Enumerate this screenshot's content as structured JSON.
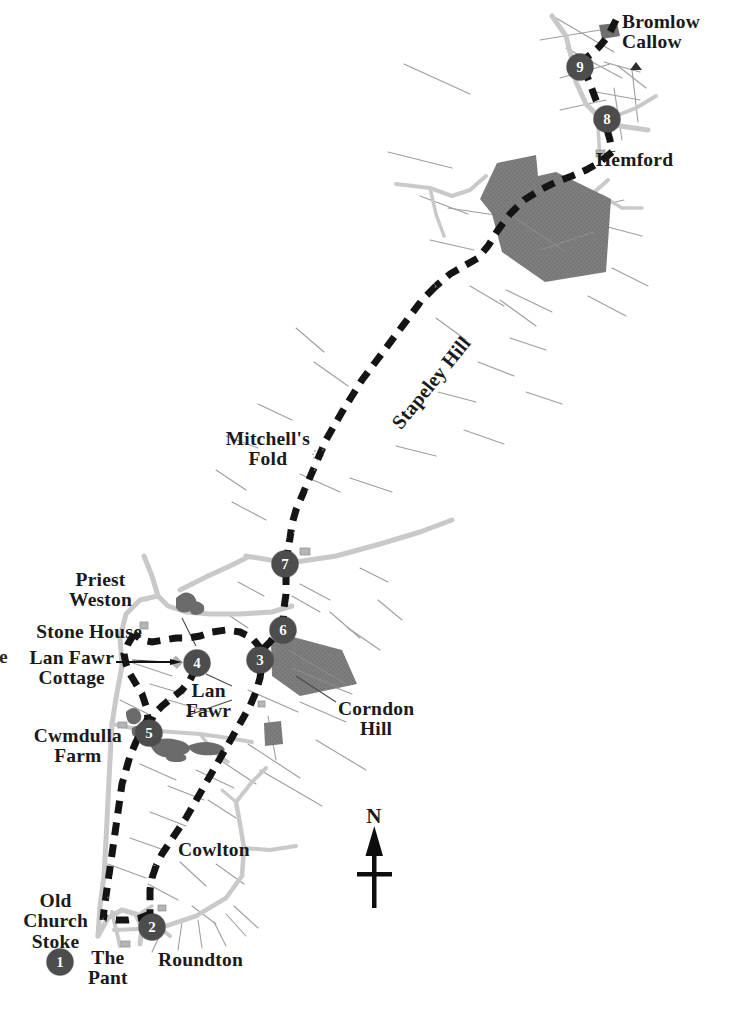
{
  "map": {
    "title": "Walk route map - Old Church Stoke to Bromlow Callow",
    "north_arrow_label": "N",
    "colors": {
      "route_dash": "#141414",
      "road": "#c9c9c9",
      "road_minor": "#d9d9d9",
      "woodland": "#7d7d7d",
      "waypoint_fill": "#4d4d4d",
      "waypoint_text": "#ffffff",
      "field_line": "#9a9a9a",
      "background": "#ffffff",
      "label_text": "#1a1a1a"
    },
    "place_labels": [
      {
        "id": "bromlow-callow",
        "text": "Bromlow\nCallow",
        "x": 622,
        "y": 21,
        "align": "left",
        "size": "sz-place"
      },
      {
        "id": "hemford",
        "text": "Hemford",
        "x": 596,
        "y": 152,
        "align": "left",
        "size": "sz-place"
      },
      {
        "id": "mitchells-fold",
        "text": "Mitchell's\nFold",
        "x": 310,
        "y": 429,
        "align": "right",
        "size": "sz-place"
      },
      {
        "id": "priest-weston",
        "text": "Priest\nWeston",
        "x": 130,
        "y": 570,
        "align": "right",
        "size": "sz-place"
      },
      {
        "id": "stone-house",
        "text": "Stone House",
        "x": 142,
        "y": 622,
        "align": "right",
        "size": "sz-place"
      },
      {
        "id": "lan-fawr-cottage",
        "text": "Lan Fawr\nCottage",
        "x": 112,
        "y": 648,
        "align": "right",
        "size": "sz-place"
      },
      {
        "id": "lan-fawr",
        "text": "Lan\nFawr",
        "x": 196,
        "y": 681,
        "align": "left",
        "size": "sz-place"
      },
      {
        "id": "corndon-hill",
        "text": "Corndon\nHill",
        "x": 341,
        "y": 699,
        "align": "left",
        "size": "sz-place"
      },
      {
        "id": "cwmdulla-farm",
        "text": "Cwmdulla\nFarm",
        "x": 119,
        "y": 726,
        "align": "right",
        "size": "sz-place"
      },
      {
        "id": "cowlton",
        "text": "Cowlton",
        "x": 180,
        "y": 840,
        "align": "left",
        "size": "sz-place"
      },
      {
        "id": "old-church-stoke",
        "text": "Old\nChurch\nStoke",
        "x": 84,
        "y": 893,
        "align": "right",
        "size": "sz-place"
      },
      {
        "id": "the-pant",
        "text": "The\nPant",
        "x": 106,
        "y": 948,
        "align": "left",
        "size": "sz-place"
      },
      {
        "id": "roundton",
        "text": "Roundton",
        "x": 158,
        "y": 950,
        "align": "left",
        "size": "sz-place"
      }
    ],
    "hill_label_rotated": {
      "id": "stapeley-hill",
      "text": "Stapeley Hill",
      "x": 404,
      "y": 412,
      "rotation_deg": -51
    },
    "edge_cut_letter": {
      "text": "e",
      "x": 0,
      "y": 648
    },
    "waypoints": [
      {
        "number": "1",
        "x": 60,
        "y": 962
      },
      {
        "number": "2",
        "x": 152,
        "y": 927
      },
      {
        "number": "3",
        "x": 260,
        "y": 660
      },
      {
        "number": "4",
        "x": 197,
        "y": 663
      },
      {
        "number": "5",
        "x": 149,
        "y": 733
      },
      {
        "number": "6",
        "x": 283,
        "y": 630
      },
      {
        "number": "7",
        "x": 285,
        "y": 564
      },
      {
        "number": "8",
        "x": 607,
        "y": 119
      },
      {
        "number": "9",
        "x": 580,
        "y": 67
      }
    ],
    "woodland_patches": [
      {
        "id": "hemford-wood",
        "points": "497,163 536,155 538,176 556,172 611,199 606,272 545,282 502,252 492,214 480,199"
      },
      {
        "id": "corndon-wood",
        "points": "282,634 342,650 357,684 300,696 272,676 271,644"
      },
      {
        "id": "small-wood-a",
        "points": "264,723 281,721 283,744 265,746"
      },
      {
        "id": "bromlow-knoll",
        "points": "599,25 617,23 620,36 602,39"
      }
    ],
    "legend_note": ""
  }
}
